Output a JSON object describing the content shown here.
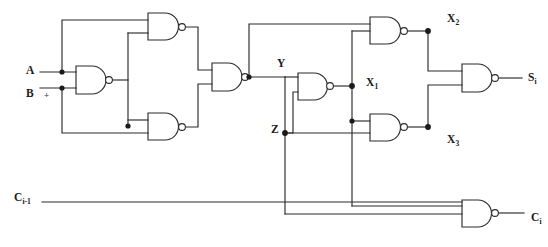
{
  "diagram": {
    "type": "logic-circuit-schematic",
    "background_color": "#ffffff",
    "line_color": "#2b2b2b"
  },
  "inputs": [
    {
      "id": "A",
      "label": "A",
      "sub": "",
      "x": 26,
      "y": 68
    },
    {
      "id": "B",
      "label": "B",
      "sub": "",
      "x": 26,
      "y": 92
    },
    {
      "id": "Cin",
      "label": "C",
      "sub": "i-1",
      "x": 14,
      "y": 195
    }
  ],
  "outputs": [
    {
      "id": "Si",
      "label": "S",
      "sub": "i",
      "x": 528,
      "y": 78
    },
    {
      "id": "Ci",
      "label": "C",
      "sub": "i",
      "x": 531,
      "y": 218
    }
  ],
  "nodes": [
    {
      "id": "Y",
      "label": "Y",
      "sub": "",
      "x": 277,
      "y": 62
    },
    {
      "id": "Z",
      "label": "Z",
      "sub": "",
      "x": 271,
      "y": 127
    },
    {
      "id": "X1",
      "label": "X",
      "sub": "1",
      "x": 366,
      "y": 80
    },
    {
      "id": "X2",
      "label": "X",
      "sub": "2",
      "x": 447,
      "y": 16
    },
    {
      "id": "X3",
      "label": "X",
      "sub": "3",
      "x": 447,
      "y": 138
    }
  ],
  "annotations": [
    {
      "id": "plus-mark",
      "text": "+",
      "x": 44,
      "y": 95
    }
  ],
  "gates": [
    {
      "id": "g1",
      "name": "nand-gate-ab",
      "type": "NAND",
      "inputs": [
        "A",
        "B"
      ],
      "output": "n1",
      "x": 76,
      "y": 66,
      "w": 30,
      "h": 28
    },
    {
      "id": "g2",
      "name": "nand-gate-top",
      "type": "NAND",
      "inputs": [
        "A",
        "n1"
      ],
      "output": "n2",
      "x": 148,
      "y": 13,
      "w": 33,
      "h": 27
    },
    {
      "id": "g3",
      "name": "nand-gate-bottom-left",
      "type": "NAND",
      "inputs": [
        "n1",
        "B"
      ],
      "output": "n3",
      "x": 148,
      "y": 113,
      "w": 33,
      "h": 27
    },
    {
      "id": "g4",
      "name": "nand-gate-y",
      "type": "NAND",
      "inputs": [
        "n2",
        "n3"
      ],
      "output": "Y",
      "x": 212,
      "y": 63,
      "w": 32,
      "h": 28
    },
    {
      "id": "g5",
      "name": "nand-gate-x1",
      "type": "NAND",
      "inputs": [
        "Y",
        "Z"
      ],
      "output": "X1",
      "x": 298,
      "y": 73,
      "w": 31,
      "h": 27
    },
    {
      "id": "g6",
      "name": "nand-gate-x2",
      "type": "NAND",
      "inputs": [
        "Y",
        "X1"
      ],
      "output": "X2",
      "x": 370,
      "y": 17,
      "w": 32,
      "h": 27
    },
    {
      "id": "g7",
      "name": "nand-gate-x3",
      "type": "NAND",
      "inputs": [
        "X1",
        "Z"
      ],
      "output": "X3",
      "x": 370,
      "y": 114,
      "w": 32,
      "h": 27
    },
    {
      "id": "g8",
      "name": "nand-gate-sum",
      "type": "NAND",
      "inputs": [
        "X2",
        "X3"
      ],
      "output": "Si",
      "x": 462,
      "y": 64,
      "w": 32,
      "h": 28
    },
    {
      "id": "g9",
      "name": "nand-gate-carry",
      "type": "NAND",
      "inputs": [
        "X1",
        "Cin"
      ],
      "output": "Ci",
      "x": 462,
      "y": 200,
      "w": 32,
      "h": 27
    }
  ],
  "junction_count": 9
}
